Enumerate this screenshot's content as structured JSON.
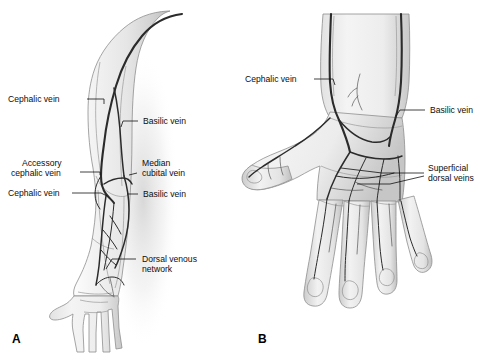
{
  "figure": {
    "background_color": "#ffffff",
    "vein_color": "#2b2b2b",
    "skin_outline_color": "#8e8e8e",
    "label_color": "#0d0d0d"
  },
  "panels": [
    {
      "id": "A",
      "name": "panel-a-arm",
      "caption": "A",
      "description": "Anterior view of right upper limb showing superficial veins",
      "labels": [
        {
          "key": "a_cephalic_upper",
          "text": "Cephalic vein",
          "side": "left"
        },
        {
          "key": "a_basilic_upper",
          "text": "Basilic vein",
          "side": "right"
        },
        {
          "key": "a_accessory_l1",
          "text": "Accessory",
          "side": "left"
        },
        {
          "key": "a_accessory_l2",
          "text": "cephalic vein",
          "side": "left"
        },
        {
          "key": "a_median_l1",
          "text": "Median",
          "side": "right"
        },
        {
          "key": "a_median_l2",
          "text": "cubital vein",
          "side": "right"
        },
        {
          "key": "a_cephalic_lower",
          "text": "Cephalic vein",
          "side": "left"
        },
        {
          "key": "a_basilic_lower",
          "text": "Basilic vein",
          "side": "right"
        },
        {
          "key": "a_dorsal_l1",
          "text": "Dorsal venous",
          "side": "right"
        },
        {
          "key": "a_dorsal_l2",
          "text": "network",
          "side": "right"
        }
      ]
    },
    {
      "id": "B",
      "name": "panel-b-hand",
      "caption": "B",
      "description": "Dorsal view of right hand showing superficial dorsal veins",
      "labels": [
        {
          "key": "b_cephalic",
          "text": "Cephalic vein",
          "side": "left"
        },
        {
          "key": "b_basilic",
          "text": "Basilic vein",
          "side": "right"
        },
        {
          "key": "b_superf_l1",
          "text": "Superficial",
          "side": "right"
        },
        {
          "key": "b_superf_l2",
          "text": "dorsal veins",
          "side": "right"
        }
      ]
    }
  ],
  "anatomy": {
    "panel_a_structures": [
      "cephalic vein (upper arm, lateral)",
      "basilic vein (upper arm, medial)",
      "accessory cephalic vein",
      "median cubital vein",
      "cephalic vein (forearm)",
      "basilic vein (forearm)",
      "dorsal venous network"
    ],
    "panel_b_structures": [
      "cephalic vein",
      "basilic vein",
      "superficial dorsal veins",
      "dorsal venous network of hand"
    ]
  }
}
